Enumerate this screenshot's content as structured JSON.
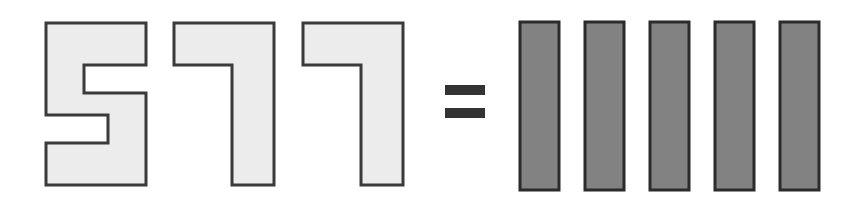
{
  "image": {
    "title": "577 equals five bars",
    "background_color": "#ffffff",
    "width": 860,
    "height": 217
  },
  "equation": {
    "left_side_label": "577",
    "operator_label": "=",
    "operator_name": "equals-sign",
    "right_side_label": "five vertical bars",
    "right_side_count": 5
  },
  "digits": {
    "fill_color": "#ececec",
    "stroke_color": "#3a3a3a",
    "stroke_width": 3,
    "items": [
      {
        "label": "5",
        "name": "digit-five",
        "x": 46,
        "y": 23,
        "width": 100,
        "height": 162
      },
      {
        "label": "7",
        "name": "digit-seven-first",
        "x": 174,
        "y": 23,
        "width": 100,
        "height": 162
      },
      {
        "label": "7",
        "name": "digit-seven-second",
        "x": 303,
        "y": 23,
        "width": 100,
        "height": 162
      }
    ]
  },
  "operator": {
    "label": "=",
    "color": "#333333",
    "bar_width": 40,
    "bar_height": 10,
    "x": 445,
    "top_bar_y": 85,
    "bottom_bar_y": 108
  },
  "bars": {
    "fill_color": "#828282",
    "stroke_color": "#2b2b2b",
    "stroke_width": 3,
    "count": 5,
    "y": 22,
    "height": 168,
    "items": [
      {
        "name": "tally-bar-1",
        "label": "1",
        "x": 520,
        "width": 39
      },
      {
        "name": "tally-bar-2",
        "label": "2",
        "x": 585,
        "width": 39
      },
      {
        "name": "tally-bar-3",
        "label": "3",
        "x": 650,
        "width": 39
      },
      {
        "name": "tally-bar-4",
        "label": "4",
        "x": 715,
        "width": 39
      },
      {
        "name": "tally-bar-5",
        "label": "5",
        "x": 780,
        "width": 39
      }
    ]
  }
}
